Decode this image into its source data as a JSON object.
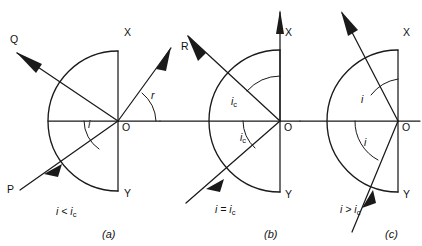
{
  "figure": {
    "stroke_color": "#1a1a1a",
    "background": "#ffffff",
    "width": 422,
    "height": 246
  },
  "panels": [
    {
      "id": "a",
      "caption": "(a)",
      "condition": "i < i",
      "condition_sub": "c",
      "condition_full": "i < i_c",
      "origin": {
        "x": 118,
        "y": 121
      },
      "radius": 70,
      "boundary_top_label": "X",
      "boundary_bottom_label": "Y",
      "origin_label": "O",
      "angle_labels": [
        {
          "text": "i",
          "x": 88,
          "y": 127
        }
      ],
      "rays": [
        {
          "name": "incident-ray",
          "label": "P",
          "label_x": 7,
          "label_y": 193
        },
        {
          "name": "refracted-ray",
          "label": "Q",
          "label_x": 10,
          "label_y": 43
        },
        {
          "name": "reflected-ray",
          "label": "R",
          "label_x": 181,
          "label_y": 50
        }
      ],
      "refraction_angle_label": "r",
      "refraction_angle_x": 151,
      "refraction_angle_y": 98
    },
    {
      "id": "b",
      "caption": "(b)",
      "condition": "i = i",
      "condition_sub": "c",
      "condition_full": "i = i_c",
      "origin": {
        "x": 280,
        "y": 121
      },
      "radius": 71,
      "boundary_top_label": "X",
      "boundary_bottom_label": "Y",
      "origin_label": "O",
      "angle_labels": [
        {
          "text": "i",
          "sub": "c",
          "x": 235,
          "y": 102
        },
        {
          "text": "i",
          "sub": "c",
          "x": 241,
          "y": 137
        }
      ],
      "rays": [
        {
          "name": "incident-ray",
          "label": "",
          "label_x": 0,
          "label_y": 0
        },
        {
          "name": "grazing-refracted-ray",
          "label": "",
          "label_x": 0,
          "label_y": 0
        },
        {
          "name": "reflected-ray",
          "label": "",
          "label_x": 0,
          "label_y": 0
        }
      ]
    },
    {
      "id": "c",
      "caption": "(c)",
      "condition": "i > i",
      "condition_sub": "c",
      "condition_full": "i > i_c",
      "origin": {
        "x": 398,
        "y": 121
      },
      "radius": 71,
      "boundary_top_label": "X",
      "boundary_bottom_label": "Y",
      "origin_label": "O",
      "angle_labels": [
        {
          "text": "i",
          "x": 360,
          "y": 98
        },
        {
          "text": "i",
          "x": 364,
          "y": 141
        }
      ],
      "rays": [
        {
          "name": "incident-ray",
          "label": "",
          "label_x": 0,
          "label_y": 0
        },
        {
          "name": "totally-reflected-ray",
          "label": "",
          "label_x": 0,
          "label_y": 0
        }
      ]
    }
  ],
  "captions": {
    "a": "(a)",
    "b": "(b)",
    "c": "(c)"
  }
}
